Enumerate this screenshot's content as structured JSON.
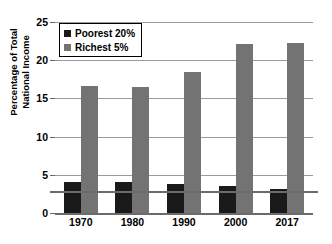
{
  "chart_data": {
    "type": "bar",
    "title": "",
    "subtitle": "",
    "xlabel": "",
    "ylabel": "Percentage of Total National Income",
    "ylabel_line1": "Percentage of Total",
    "ylabel_line2": "National Income",
    "categories": [
      "1970",
      "1980",
      "1990",
      "2000",
      "2017"
    ],
    "series": [
      {
        "name": "Poorest 20%",
        "color": "#1a1a1a",
        "values": [
          4.0,
          4.1,
          3.8,
          3.6,
          3.1
        ]
      },
      {
        "name": "Richest 5%",
        "color": "#737373",
        "values": [
          16.6,
          16.5,
          18.5,
          22.1,
          22.3
        ]
      }
    ],
    "ylim": [
      0,
      25
    ],
    "yticks": [
      0,
      5,
      10,
      15,
      20,
      25
    ],
    "ytick_labels": [
      "0",
      "5",
      "10",
      "15",
      "20",
      "25"
    ],
    "grid": true,
    "grid_axis": "y",
    "legend_position": "upper left",
    "background_color": "#ffffff",
    "gridline_color": "#9a9a9a",
    "axis_color": "#6b6b6b"
  },
  "legend": {
    "entries": [
      {
        "label": "Poorest 20%",
        "color": "#1a1a1a"
      },
      {
        "label": "Richest 5%",
        "color": "#737373"
      }
    ]
  }
}
